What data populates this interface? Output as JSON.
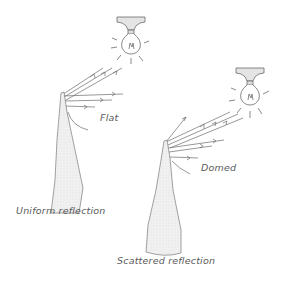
{
  "diagram": {
    "type": "illustration",
    "style": "pencil sketch",
    "colors": {
      "stroke": "#6b6b6b",
      "fill": "#ececec",
      "text": "#5a5a5a",
      "background": "#ffffff"
    },
    "panels": [
      {
        "id": "flat",
        "tip_label": "Flat",
        "caption": "Uniform reflection",
        "light_source": "ceiling light bulb",
        "incoming_rays": 3,
        "reflected_rays": 3
      },
      {
        "id": "domed",
        "tip_label": "Domed",
        "caption": "Scattered reflection",
        "light_source": "ceiling light bulb",
        "incoming_rays": 3,
        "reflected_rays": 4
      }
    ]
  }
}
